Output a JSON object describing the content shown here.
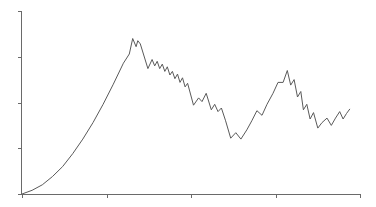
{
  "chart_data": {
    "type": "line",
    "title": "",
    "xlabel": "",
    "ylabel": "",
    "xlim": [
      0,
      4
    ],
    "ylim": [
      0,
      4
    ],
    "x_ticks": [
      0,
      1,
      2,
      3,
      4
    ],
    "y_ticks": [
      0,
      1,
      2,
      3,
      4
    ],
    "x_tick_labels": [],
    "y_tick_labels": [],
    "grid": false,
    "legend": null,
    "colors": {
      "line": "#5a5a5a",
      "axis": "#6a6a6a",
      "background": "#ffffff"
    },
    "series": [
      {
        "name": "series-1",
        "x": [
          0.0,
          0.12,
          0.24,
          0.36,
          0.48,
          0.6,
          0.72,
          0.84,
          0.96,
          1.08,
          1.2,
          1.27,
          1.31,
          1.35,
          1.37,
          1.4,
          1.49,
          1.54,
          1.57,
          1.6,
          1.63,
          1.66,
          1.69,
          1.72,
          1.75,
          1.78,
          1.81,
          1.84,
          1.87,
          1.9,
          1.93,
          1.96,
          2.03,
          2.09,
          2.13,
          2.18,
          2.24,
          2.28,
          2.32,
          2.36,
          2.41,
          2.47,
          2.53,
          2.59,
          2.66,
          2.72,
          2.78,
          2.84,
          2.9,
          2.97,
          3.03,
          3.09,
          3.14,
          3.18,
          3.22,
          3.26,
          3.3,
          3.33,
          3.37,
          3.41,
          3.45,
          3.5,
          3.55,
          3.61,
          3.66,
          3.71,
          3.76,
          3.8,
          3.84,
          3.88
        ],
        "y": [
          0.0,
          0.08,
          0.2,
          0.38,
          0.6,
          0.88,
          1.2,
          1.56,
          1.96,
          2.4,
          2.86,
          3.06,
          3.4,
          3.22,
          3.35,
          3.28,
          2.74,
          2.94,
          2.8,
          2.9,
          2.74,
          2.84,
          2.68,
          2.78,
          2.6,
          2.68,
          2.52,
          2.62,
          2.44,
          2.54,
          2.34,
          2.42,
          1.94,
          2.1,
          2.02,
          2.2,
          1.84,
          1.96,
          1.8,
          1.88,
          1.6,
          1.22,
          1.34,
          1.2,
          1.4,
          1.6,
          1.82,
          1.72,
          1.96,
          2.2,
          2.44,
          2.44,
          2.7,
          2.38,
          2.5,
          2.12,
          2.24,
          1.84,
          1.96,
          1.64,
          1.78,
          1.44,
          1.56,
          1.66,
          1.5,
          1.66,
          1.8,
          1.64,
          1.76,
          1.86
        ]
      }
    ]
  },
  "plot_area": {
    "left": 22,
    "top": 11,
    "right": 360,
    "bottom": 194
  }
}
